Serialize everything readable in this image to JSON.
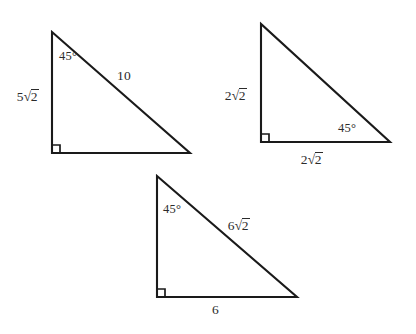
{
  "figure": {
    "background_color": "#ffffff",
    "stroke_color": "#1a1a1a",
    "text_color": "#2b2b2b",
    "triangles": [
      {
        "id": "triangle-1",
        "name": "left-triangle",
        "points": "52,32 52,153 190,153",
        "right_angle_path": "M 52 145 L 60 145 L 60 153",
        "leg_vertical_label": {
          "prefix": "5",
          "radicand": "2",
          "text": "5√2"
        },
        "hypotenuse_label": {
          "text": "10"
        },
        "angle_label": {
          "value": "45",
          "text": "45°"
        }
      },
      {
        "id": "triangle-2",
        "name": "right-triangle",
        "points": "261,24 261,142 390,142",
        "right_angle_path": "M 261 134 L 269 134 L 269 142",
        "leg_vertical_label": {
          "prefix": "2",
          "radicand": "2",
          "text": "2√2"
        },
        "leg_base_label": {
          "prefix": "2",
          "radicand": "2",
          "text": "2√2"
        },
        "angle_label": {
          "value": "45",
          "text": "45°"
        }
      },
      {
        "id": "triangle-3",
        "name": "bottom-triangle",
        "points": "157,176 157,297 297,297",
        "right_angle_path": "M 157 289 L 165 289 L 165 297",
        "hypotenuse_label": {
          "prefix": "6",
          "radicand": "2",
          "text": "6√2"
        },
        "leg_base_label": {
          "text": "6"
        },
        "angle_label": {
          "value": "45",
          "text": "45°"
        }
      }
    ]
  },
  "labels": {
    "t1_leg": {
      "prefix": "5",
      "radicand": "2"
    },
    "t1_hyp": "10",
    "t1_angle": "45°",
    "t2_leg": {
      "prefix": "2",
      "radicand": "2"
    },
    "t2_base": {
      "prefix": "2",
      "radicand": "2"
    },
    "t2_angle": "45°",
    "t3_hyp": {
      "prefix": "6",
      "radicand": "2"
    },
    "t3_base": "6",
    "t3_angle": "45°"
  }
}
